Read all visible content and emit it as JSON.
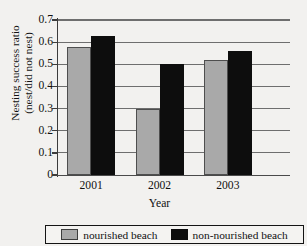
{
  "chart_data": {
    "type": "bar",
    "title": "",
    "categories": [
      "2001",
      "2002",
      "2003"
    ],
    "series": [
      {
        "name": "nourished beach",
        "color": "#a9a9a9",
        "values": [
          0.58,
          0.3,
          0.52
        ]
      },
      {
        "name": "non-nourished beach",
        "color": "#0d0d0d",
        "values": [
          0.63,
          0.5,
          0.56
        ]
      }
    ],
    "xlabel": "Year",
    "ylabel_line1": "Nesting success ratio",
    "ylabel_line2": "(nest/did not nest)",
    "ylim": [
      0,
      0.7
    ],
    "yticks": [
      "0.7",
      "0.6",
      "0.5",
      "0.4",
      "0.3",
      "0.2",
      "0.1",
      "0"
    ],
    "ytick_values": [
      0.7,
      0.6,
      0.5,
      0.4,
      0.3,
      0.2,
      0.1,
      0
    ],
    "grid": "horizontal",
    "legend_position": "bottom"
  },
  "legend": {
    "entries": [
      {
        "label": "nourished beach"
      },
      {
        "label": "non-nourished beach"
      }
    ]
  }
}
